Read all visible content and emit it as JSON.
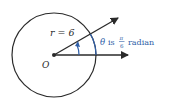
{
  "diagram": {
    "radius_label": "r = 6",
    "origin_label": "O",
    "angle_symbol": "θ",
    "angle_text_is": "is",
    "angle_frac_num": "π",
    "angle_frac_den": "6",
    "angle_unit": "radian",
    "colors": {
      "ink": "#2a2a2a",
      "accent": "#2f5fa8"
    }
  }
}
